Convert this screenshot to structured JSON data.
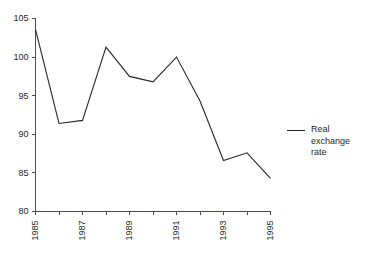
{
  "chart_data": {
    "type": "line",
    "title": "",
    "subtitle": "",
    "xlabel": "",
    "ylabel": "",
    "xlim": [
      1985,
      1995
    ],
    "ylim": [
      80,
      105
    ],
    "grid": false,
    "legend_position": "right",
    "x": [
      1985,
      1986,
      1987,
      1988,
      1989,
      1990,
      1991,
      1992,
      1993,
      1994,
      1995
    ],
    "series": [
      {
        "name": "Real exchange rate",
        "color": "#262626",
        "values": [
          103.6,
          91.4,
          91.8,
          101.3,
          97.5,
          96.8,
          100.0,
          94.3,
          86.6,
          87.6,
          84.3
        ]
      }
    ],
    "y_ticks": [
      80,
      85,
      90,
      95,
      100,
      105
    ],
    "y_tick_labels": [
      "80",
      "85",
      "90",
      "95",
      "100",
      "105"
    ],
    "x_ticks": [
      1985,
      1986,
      1987,
      1988,
      1989,
      1990,
      1991,
      1992,
      1993,
      1994,
      1995
    ],
    "x_tick_labels": [
      "1985",
      "",
      "1987",
      "",
      "1989",
      "",
      "1991",
      "",
      "1993",
      "",
      "1995"
    ],
    "x_tick_labels_visible": [
      "1985",
      "1987",
      "1989",
      "1991",
      "1993",
      "1995"
    ],
    "x_label_rotation": -90,
    "annotations": []
  },
  "legend": {
    "entries": [
      {
        "label": "Real exchange rate",
        "swatch": "line-swatch",
        "color": "#262626"
      }
    ]
  },
  "axes": {
    "y_axis_name": "value-axis",
    "x_axis_name": "year-axis"
  }
}
